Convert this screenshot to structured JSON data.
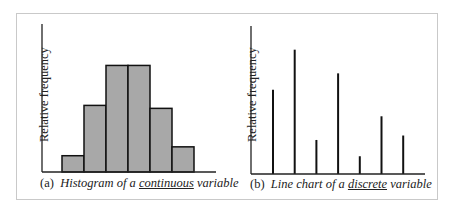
{
  "chart_data": [
    {
      "type": "bar",
      "subtype": "histogram",
      "caption_label": "(a)",
      "caption_pre": "Histogram of a ",
      "caption_emph": "continuous",
      "caption_post": " variable",
      "ylabel": "Relative frequency",
      "xlabel": "",
      "grid": false,
      "legend": null,
      "categories": [
        "bin1",
        "bin2",
        "bin3",
        "bin4",
        "bin5",
        "bin6"
      ],
      "values": [
        0.11,
        0.45,
        0.72,
        0.72,
        0.43,
        0.17
      ],
      "bar_color": "#a8a8a8",
      "edge_color": "#111111",
      "ylim": [
        0,
        1
      ]
    },
    {
      "type": "bar",
      "subtype": "line-chart (vertical spikes)",
      "caption_label": "(b)",
      "caption_pre": "Line chart of a ",
      "caption_emph": "discrete",
      "caption_post": " variable",
      "ylabel": "Relative frequency",
      "xlabel": "",
      "grid": false,
      "legend": null,
      "categories": [
        "x1",
        "x2",
        "x3",
        "x4",
        "x5",
        "x6",
        "x7"
      ],
      "values": [
        0.57,
        0.84,
        0.23,
        0.68,
        0.12,
        0.39,
        0.26
      ],
      "line_color": "#111111",
      "ylim": [
        0,
        1
      ]
    }
  ]
}
